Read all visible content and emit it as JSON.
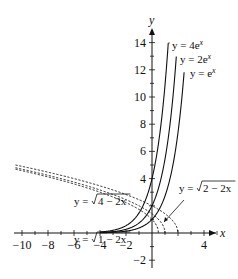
{
  "chart_data": {
    "type": "line",
    "title": "",
    "xlabel": "x",
    "ylabel": "y",
    "xlim": [
      -10.5,
      5.2
    ],
    "ylim": [
      -3,
      15
    ],
    "grid": false,
    "x_ticks": [
      -10,
      -8,
      -6,
      -4,
      -2,
      4
    ],
    "y_ticks": [
      -2,
      4,
      6,
      8,
      10,
      12,
      14
    ],
    "x_tick_labels": [
      "−10",
      "−8",
      "−6",
      "−4",
      "−2",
      "4"
    ],
    "y_tick_labels": [
      "−2",
      "4",
      "6",
      "8",
      "10",
      "12",
      "14"
    ],
    "series": [
      {
        "name": "y = 4e^x",
        "label_main": "y = 4e",
        "label_sup": "x",
        "style": "solid",
        "function": "4*exp(x)",
        "x_range": [
          -4,
          1.25
        ]
      },
      {
        "name": "y = 2e^x",
        "label_main": "y = 2e",
        "label_sup": "x",
        "style": "solid",
        "function": "2*exp(x)",
        "x_range": [
          -4,
          1.87
        ]
      },
      {
        "name": "y = e^x",
        "label_main": "y = e",
        "label_sup": "x",
        "style": "solid",
        "function": "exp(x)",
        "x_range": [
          -4,
          2.47
        ]
      },
      {
        "name": "y = sqrt(4 - 2x)",
        "label_main": "y = ",
        "label_rad": "4 − 2x",
        "style": "dashed",
        "function": "sqrt(4-2x)",
        "x_range": [
          -10.5,
          2
        ]
      },
      {
        "name": "y = sqrt(2 - 2x)",
        "label_main": "y = ",
        "label_rad": "2 − 2x",
        "style": "dashed",
        "function": "sqrt(2-2x)",
        "x_range": [
          -10.5,
          1
        ]
      },
      {
        "name": "y = sqrt(1 - 2x)",
        "label_main": "y = ",
        "label_rad": "1 − 2x",
        "style": "dashed",
        "function": "sqrt(1-2x)",
        "x_range": [
          -10.5,
          0.5
        ]
      }
    ]
  },
  "axes": {
    "x_label": "x",
    "y_label": "y"
  },
  "colors": {
    "ink": "#111111",
    "background": "#ffffff"
  }
}
